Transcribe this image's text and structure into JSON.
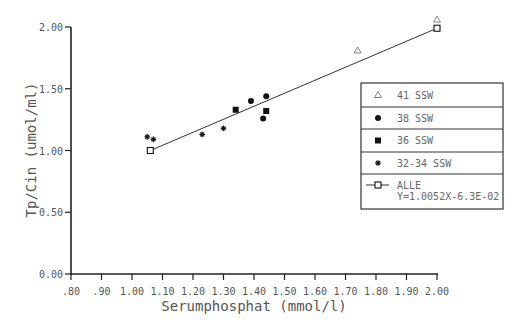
{
  "chart_data": {
    "type": "scatter",
    "title": "",
    "xlabel": "Serumphosphat (mmol/l)",
    "ylabel": "Tp/Cin (umol/ml)",
    "xlim": [
      0.8,
      2.0
    ],
    "ylim": [
      0.0,
      2.0
    ],
    "x_ticks": [
      ".80",
      ".90",
      "1.00",
      "1.10",
      "1.20",
      "1.30",
      "1.40",
      "1.50",
      "1.60",
      "1.70",
      "1.80",
      "1.90",
      "2.00"
    ],
    "x_tick_values": [
      0.8,
      0.9,
      1.0,
      1.1,
      1.2,
      1.3,
      1.4,
      1.5,
      1.6,
      1.7,
      1.8,
      1.9,
      2.0
    ],
    "y_ticks": [
      "0.00",
      "0.50",
      "1.00",
      "1.50",
      "2.00"
    ],
    "y_tick_values": [
      0.0,
      0.5,
      1.0,
      1.5,
      2.0
    ],
    "grid": false,
    "legend_position": "right",
    "series": [
      {
        "name": "41 SSW",
        "marker": "triangle-open",
        "points": [
          {
            "x": 1.74,
            "y": 1.81
          },
          {
            "x": 2.0,
            "y": 2.06
          }
        ]
      },
      {
        "name": "38 SSW",
        "marker": "circle-filled",
        "points": [
          {
            "x": 1.39,
            "y": 1.4
          },
          {
            "x": 1.44,
            "y": 1.44
          },
          {
            "x": 1.43,
            "y": 1.26
          }
        ]
      },
      {
        "name": "36 SSW",
        "marker": "square-filled",
        "points": [
          {
            "x": 1.34,
            "y": 1.33
          },
          {
            "x": 1.44,
            "y": 1.32
          }
        ]
      },
      {
        "name": "32-34 SSW",
        "marker": "star",
        "points": [
          {
            "x": 1.05,
            "y": 1.11
          },
          {
            "x": 1.07,
            "y": 1.09
          },
          {
            "x": 1.23,
            "y": 1.13
          },
          {
            "x": 1.3,
            "y": 1.18
          }
        ]
      },
      {
        "name": "ALLE",
        "marker": "square-open-line",
        "equation": "Y=1.0052X-6.3E-02",
        "slope": 1.0052,
        "intercept": -0.063,
        "points": [
          {
            "x": 1.06,
            "y": 1.0
          },
          {
            "x": 2.0,
            "y": 1.99
          }
        ]
      }
    ],
    "legend": [
      {
        "label": "41 SSW",
        "marker": "triangle-open"
      },
      {
        "label": "38 SSW",
        "marker": "circle-filled"
      },
      {
        "label": "36 SSW",
        "marker": "square-filled"
      },
      {
        "label": "32-34 SSW",
        "marker": "star"
      },
      {
        "label": "ALLE",
        "sublabel": "Y=1.0052X-6.3E-02",
        "marker": "square-open-line"
      }
    ]
  },
  "colors": {
    "axis": "#222222",
    "text": "#555555",
    "marker": "#111111",
    "background": "#ffffff"
  }
}
